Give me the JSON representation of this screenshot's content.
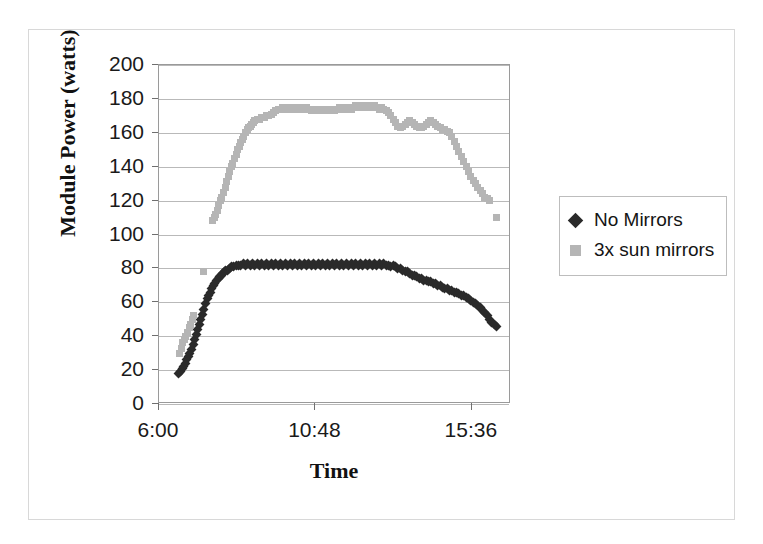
{
  "figure": {
    "background": "#ffffff",
    "border_color": "#d8d8d8"
  },
  "chart_data": {
    "type": "scatter",
    "title": "",
    "xlabel": "Time",
    "ylabel": "Module Power (watts)",
    "xlim": [
      0.25,
      0.7
    ],
    "ylim": [
      0,
      200
    ],
    "ytick_values": [
      0,
      20,
      40,
      60,
      80,
      100,
      120,
      140,
      160,
      180,
      200
    ],
    "ytick_labels": [
      "0",
      "20",
      "40",
      "60",
      "80",
      "100",
      "120",
      "140",
      "160",
      "180",
      "200"
    ],
    "xtick_values": [
      0.25,
      0.45,
      0.65
    ],
    "xtick_labels": [
      "6:00",
      "10:48",
      "15:36"
    ],
    "grid": "horizontal",
    "legend_position": "right",
    "series": [
      {
        "name": "No Mirrors",
        "color": "#2a2a2a",
        "marker": "diamond",
        "points": [
          [
            0.2755,
            18
          ],
          [
            0.2775,
            19
          ],
          [
            0.2795,
            21
          ],
          [
            0.2815,
            22
          ],
          [
            0.2835,
            24
          ],
          [
            0.2855,
            26
          ],
          [
            0.2875,
            28
          ],
          [
            0.2895,
            30
          ],
          [
            0.2915,
            32
          ],
          [
            0.2935,
            35
          ],
          [
            0.2955,
            38
          ],
          [
            0.2975,
            41
          ],
          [
            0.2995,
            44
          ],
          [
            0.3015,
            47
          ],
          [
            0.3035,
            50
          ],
          [
            0.3055,
            53
          ],
          [
            0.3075,
            56
          ],
          [
            0.3095,
            59
          ],
          [
            0.3115,
            62
          ],
          [
            0.3135,
            64
          ],
          [
            0.3155,
            66
          ],
          [
            0.3175,
            68
          ],
          [
            0.3195,
            70
          ],
          [
            0.3215,
            71
          ],
          [
            0.3235,
            73
          ],
          [
            0.3255,
            74
          ],
          [
            0.3275,
            75
          ],
          [
            0.3295,
            76
          ],
          [
            0.3315,
            77
          ],
          [
            0.3335,
            78
          ],
          [
            0.3355,
            79
          ],
          [
            0.3375,
            79
          ],
          [
            0.3395,
            80
          ],
          [
            0.3425,
            81
          ],
          [
            0.3455,
            81
          ],
          [
            0.3485,
            82
          ],
          [
            0.3515,
            82
          ],
          [
            0.3545,
            82
          ],
          [
            0.3575,
            83
          ],
          [
            0.3605,
            82
          ],
          [
            0.3635,
            83
          ],
          [
            0.3665,
            82
          ],
          [
            0.3695,
            83
          ],
          [
            0.3725,
            82
          ],
          [
            0.3755,
            83
          ],
          [
            0.3785,
            82
          ],
          [
            0.3815,
            83
          ],
          [
            0.3845,
            82
          ],
          [
            0.3875,
            83
          ],
          [
            0.3905,
            82
          ],
          [
            0.3935,
            83
          ],
          [
            0.3965,
            82
          ],
          [
            0.3995,
            83
          ],
          [
            0.4025,
            82
          ],
          [
            0.4055,
            83
          ],
          [
            0.4085,
            82
          ],
          [
            0.4115,
            83
          ],
          [
            0.4145,
            82
          ],
          [
            0.4175,
            83
          ],
          [
            0.4205,
            82
          ],
          [
            0.4235,
            83
          ],
          [
            0.4265,
            82
          ],
          [
            0.4295,
            83
          ],
          [
            0.4325,
            82
          ],
          [
            0.4355,
            83
          ],
          [
            0.4385,
            82
          ],
          [
            0.4415,
            83
          ],
          [
            0.4445,
            82
          ],
          [
            0.4475,
            83
          ],
          [
            0.4505,
            82
          ],
          [
            0.4535,
            83
          ],
          [
            0.4565,
            82
          ],
          [
            0.4595,
            83
          ],
          [
            0.4625,
            82
          ],
          [
            0.4655,
            83
          ],
          [
            0.4685,
            82
          ],
          [
            0.4715,
            83
          ],
          [
            0.4745,
            82
          ],
          [
            0.4775,
            83
          ],
          [
            0.4805,
            82
          ],
          [
            0.4835,
            83
          ],
          [
            0.4865,
            82
          ],
          [
            0.4895,
            83
          ],
          [
            0.4925,
            82
          ],
          [
            0.4955,
            83
          ],
          [
            0.4985,
            82
          ],
          [
            0.5015,
            83
          ],
          [
            0.5045,
            82
          ],
          [
            0.5075,
            83
          ],
          [
            0.5105,
            82
          ],
          [
            0.5135,
            83
          ],
          [
            0.5165,
            82
          ],
          [
            0.5195,
            83
          ],
          [
            0.5225,
            82
          ],
          [
            0.5255,
            83
          ],
          [
            0.5285,
            82
          ],
          [
            0.5315,
            83
          ],
          [
            0.5345,
            82
          ],
          [
            0.5375,
            83
          ],
          [
            0.5405,
            82
          ],
          [
            0.5435,
            82
          ],
          [
            0.5465,
            81
          ],
          [
            0.5495,
            82
          ],
          [
            0.5525,
            81
          ],
          [
            0.5555,
            80
          ],
          [
            0.5585,
            80
          ],
          [
            0.5615,
            79
          ],
          [
            0.5645,
            78
          ],
          [
            0.5675,
            78
          ],
          [
            0.5705,
            77
          ],
          [
            0.5735,
            76
          ],
          [
            0.5765,
            76
          ],
          [
            0.5795,
            75
          ],
          [
            0.5825,
            74
          ],
          [
            0.5855,
            74
          ],
          [
            0.5885,
            73
          ],
          [
            0.5915,
            73
          ],
          [
            0.5945,
            72
          ],
          [
            0.5975,
            72
          ],
          [
            0.6005,
            71
          ],
          [
            0.6035,
            71
          ],
          [
            0.6065,
            70
          ],
          [
            0.6095,
            70
          ],
          [
            0.6125,
            69
          ],
          [
            0.6155,
            68
          ],
          [
            0.6185,
            68
          ],
          [
            0.6215,
            67
          ],
          [
            0.6245,
            67
          ],
          [
            0.6275,
            66
          ],
          [
            0.6305,
            66
          ],
          [
            0.6335,
            65
          ],
          [
            0.6365,
            64
          ],
          [
            0.6395,
            64
          ],
          [
            0.6425,
            63
          ],
          [
            0.6455,
            62
          ],
          [
            0.6485,
            61
          ],
          [
            0.6515,
            60
          ],
          [
            0.6545,
            59
          ],
          [
            0.6575,
            58
          ],
          [
            0.6605,
            57
          ],
          [
            0.6635,
            55
          ],
          [
            0.6665,
            54
          ],
          [
            0.6695,
            52
          ],
          [
            0.6725,
            50
          ],
          [
            0.6755,
            48
          ],
          [
            0.6785,
            47
          ],
          [
            0.6815,
            46
          ]
        ]
      },
      {
        "name": "3x sun mirrors",
        "color": "#b5b5b5",
        "marker": "square",
        "points": [
          [
            0.2765,
            30
          ],
          [
            0.2785,
            33
          ],
          [
            0.2805,
            36
          ],
          [
            0.2825,
            38
          ],
          [
            0.2845,
            40
          ],
          [
            0.2865,
            42
          ],
          [
            0.2885,
            45
          ],
          [
            0.2905,
            47
          ],
          [
            0.2925,
            50
          ],
          [
            0.2945,
            52
          ],
          [
            0.3065,
            78
          ],
          [
            0.3185,
            108
          ],
          [
            0.3205,
            110
          ],
          [
            0.3225,
            112
          ],
          [
            0.3245,
            114
          ],
          [
            0.3265,
            117
          ],
          [
            0.3285,
            120
          ],
          [
            0.3305,
            122
          ],
          [
            0.3325,
            125
          ],
          [
            0.3345,
            128
          ],
          [
            0.3365,
            131
          ],
          [
            0.3385,
            134
          ],
          [
            0.3405,
            137
          ],
          [
            0.3425,
            140
          ],
          [
            0.3445,
            142
          ],
          [
            0.3465,
            145
          ],
          [
            0.3485,
            147
          ],
          [
            0.3505,
            150
          ],
          [
            0.3525,
            152
          ],
          [
            0.3545,
            154
          ],
          [
            0.3565,
            156
          ],
          [
            0.3585,
            158
          ],
          [
            0.3605,
            160
          ],
          [
            0.3625,
            162
          ],
          [
            0.3645,
            163
          ],
          [
            0.3665,
            164
          ],
          [
            0.3685,
            165
          ],
          [
            0.3705,
            166
          ],
          [
            0.3725,
            167
          ],
          [
            0.3755,
            168
          ],
          [
            0.3785,
            168
          ],
          [
            0.3815,
            169
          ],
          [
            0.3845,
            169
          ],
          [
            0.3875,
            170
          ],
          [
            0.3905,
            170
          ],
          [
            0.3935,
            171
          ],
          [
            0.3965,
            172
          ],
          [
            0.3995,
            173
          ],
          [
            0.4025,
            174
          ],
          [
            0.4055,
            174
          ],
          [
            0.4085,
            175
          ],
          [
            0.4115,
            174
          ],
          [
            0.4145,
            175
          ],
          [
            0.4175,
            174
          ],
          [
            0.4205,
            175
          ],
          [
            0.4235,
            174
          ],
          [
            0.4265,
            175
          ],
          [
            0.4295,
            174
          ],
          [
            0.4325,
            175
          ],
          [
            0.4355,
            174
          ],
          [
            0.4385,
            175
          ],
          [
            0.4415,
            174
          ],
          [
            0.4445,
            173
          ],
          [
            0.4475,
            174
          ],
          [
            0.4505,
            173
          ],
          [
            0.4535,
            174
          ],
          [
            0.4565,
            173
          ],
          [
            0.4595,
            174
          ],
          [
            0.4625,
            173
          ],
          [
            0.4655,
            174
          ],
          [
            0.4685,
            173
          ],
          [
            0.4715,
            174
          ],
          [
            0.4745,
            173
          ],
          [
            0.4775,
            174
          ],
          [
            0.4805,
            175
          ],
          [
            0.4835,
            174
          ],
          [
            0.4865,
            175
          ],
          [
            0.4895,
            174
          ],
          [
            0.4925,
            175
          ],
          [
            0.4955,
            174
          ],
          [
            0.4985,
            175
          ],
          [
            0.5015,
            176
          ],
          [
            0.5045,
            175
          ],
          [
            0.5075,
            176
          ],
          [
            0.5105,
            175
          ],
          [
            0.5135,
            176
          ],
          [
            0.5165,
            175
          ],
          [
            0.5195,
            176
          ],
          [
            0.5225,
            175
          ],
          [
            0.5255,
            176
          ],
          [
            0.5285,
            175
          ],
          [
            0.5315,
            174
          ],
          [
            0.5345,
            175
          ],
          [
            0.5375,
            174
          ],
          [
            0.5405,
            173
          ],
          [
            0.5435,
            172
          ],
          [
            0.5465,
            170
          ],
          [
            0.5495,
            168
          ],
          [
            0.5525,
            166
          ],
          [
            0.5555,
            164
          ],
          [
            0.5585,
            163
          ],
          [
            0.5615,
            164
          ],
          [
            0.5645,
            165
          ],
          [
            0.5675,
            166
          ],
          [
            0.5705,
            167
          ],
          [
            0.5735,
            166
          ],
          [
            0.5765,
            165
          ],
          [
            0.5795,
            164
          ],
          [
            0.5825,
            163
          ],
          [
            0.5855,
            163
          ],
          [
            0.5885,
            164
          ],
          [
            0.5915,
            165
          ],
          [
            0.5945,
            166
          ],
          [
            0.5975,
            167
          ],
          [
            0.6005,
            166
          ],
          [
            0.6035,
            165
          ],
          [
            0.6065,
            164
          ],
          [
            0.6095,
            163
          ],
          [
            0.6125,
            162
          ],
          [
            0.6155,
            162
          ],
          [
            0.6185,
            161
          ],
          [
            0.6215,
            160
          ],
          [
            0.6245,
            158
          ],
          [
            0.6275,
            155
          ],
          [
            0.6305,
            152
          ],
          [
            0.6335,
            149
          ],
          [
            0.6365,
            146
          ],
          [
            0.6395,
            143
          ],
          [
            0.6425,
            140
          ],
          [
            0.6455,
            137
          ],
          [
            0.6485,
            134
          ],
          [
            0.6515,
            132
          ],
          [
            0.6545,
            130
          ],
          [
            0.6575,
            128
          ],
          [
            0.6605,
            126
          ],
          [
            0.6635,
            124
          ],
          [
            0.6665,
            122
          ],
          [
            0.6695,
            121
          ],
          [
            0.6725,
            120
          ],
          [
            0.6815,
            110
          ]
        ]
      }
    ]
  },
  "legend": {
    "items": [
      {
        "label": "No Mirrors",
        "color": "#2a2a2a",
        "marker": "diamond"
      },
      {
        "label": "3x sun mirrors",
        "color": "#b5b5b5",
        "marker": "square"
      }
    ]
  }
}
